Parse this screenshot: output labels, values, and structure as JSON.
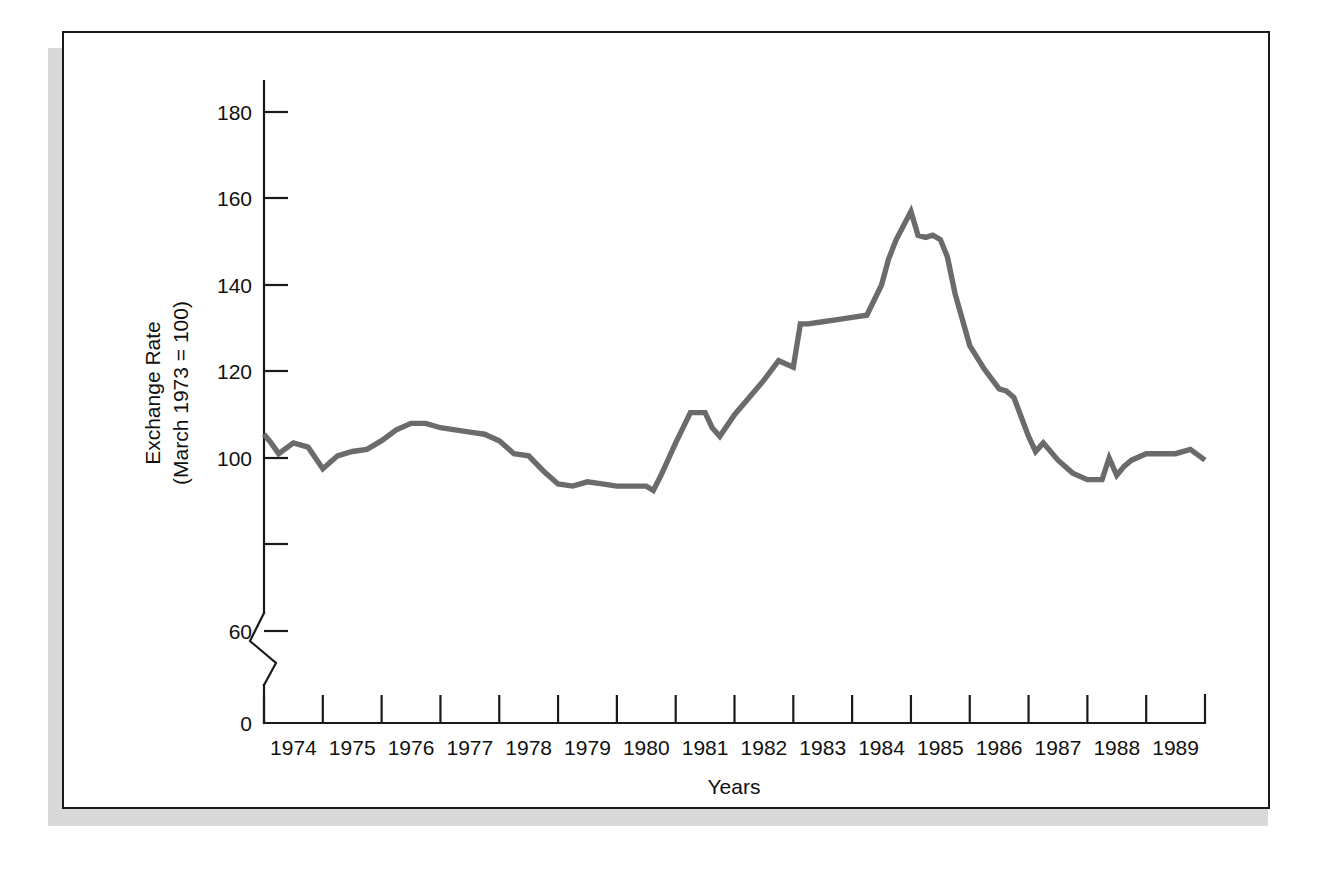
{
  "figure": {
    "frame": {
      "border_color": "#1a1a1a",
      "shadow_color": "#d9d9d9",
      "background": "#ffffff"
    }
  },
  "chart_data": {
    "type": "line",
    "title": "",
    "xlabel": "Years",
    "ylabel_line1": "Exchange Rate",
    "ylabel_line2": "(March 1973 = 100)",
    "line_color": "#6b6b6b",
    "axis_color": "#1a1a1a",
    "grid": false,
    "legend": "none",
    "axis_break": {
      "present": true,
      "between": [
        0,
        60
      ],
      "style": "zigzag"
    },
    "ylim": [
      56,
      190
    ],
    "yticks": [
      0,
      60,
      80,
      100,
      120,
      140,
      160,
      180
    ],
    "ytick_labels": [
      "0",
      "60",
      "",
      "100",
      "120",
      "140",
      "160",
      "180"
    ],
    "xlim": [
      1974.0,
      1990.0
    ],
    "xticks": [
      1974,
      1975,
      1976,
      1977,
      1978,
      1979,
      1980,
      1981,
      1982,
      1983,
      1984,
      1985,
      1986,
      1987,
      1988,
      1989,
      1990
    ],
    "xtick_labels": [
      "1974",
      "1975",
      "1976",
      "1977",
      "1978",
      "1979",
      "1980",
      "1981",
      "1982",
      "1983",
      "1984",
      "1985",
      "1986",
      "1987",
      "1988",
      "1989"
    ],
    "series": [
      {
        "name": "Trade-weighted exchange rate index",
        "x": [
          1974.0,
          1974.12,
          1974.25,
          1974.5,
          1974.75,
          1975.0,
          1975.25,
          1975.5,
          1975.75,
          1976.0,
          1976.25,
          1976.5,
          1976.75,
          1977.0,
          1977.25,
          1977.5,
          1977.75,
          1978.0,
          1978.25,
          1978.5,
          1978.75,
          1979.0,
          1979.25,
          1979.5,
          1979.75,
          1980.0,
          1980.25,
          1980.5,
          1980.62,
          1980.75,
          1981.0,
          1981.25,
          1981.5,
          1981.62,
          1981.75,
          1982.0,
          1982.25,
          1982.5,
          1982.75,
          1983.0,
          1983.12,
          1983.25,
          1983.5,
          1983.75,
          1984.0,
          1984.25,
          1984.5,
          1984.62,
          1984.75,
          1985.0,
          1985.12,
          1985.25,
          1985.37,
          1985.5,
          1985.62,
          1985.75,
          1986.0,
          1986.25,
          1986.5,
          1986.62,
          1986.75,
          1987.0,
          1987.12,
          1987.25,
          1987.5,
          1987.75,
          1988.0,
          1988.25,
          1988.37,
          1988.5,
          1988.62,
          1988.75,
          1989.0,
          1989.25,
          1989.5,
          1989.75,
          1990.0
        ],
        "y": [
          105.5,
          103.5,
          101.0,
          103.5,
          102.5,
          97.5,
          100.5,
          101.5,
          102.0,
          104.0,
          106.5,
          108.0,
          108.0,
          107.0,
          106.5,
          106.0,
          105.5,
          104.0,
          101.0,
          100.5,
          97.0,
          94.0,
          93.5,
          94.5,
          94.0,
          93.5,
          93.5,
          93.5,
          92.5,
          96.0,
          103.5,
          110.5,
          110.5,
          107.0,
          105.0,
          110.0,
          114.0,
          118.0,
          122.5,
          121.0,
          131.0,
          131.0,
          131.5,
          132.0,
          132.5,
          133.0,
          140.0,
          146.0,
          150.5,
          157.0,
          151.5,
          151.0,
          151.5,
          150.5,
          146.5,
          138.0,
          126.0,
          120.5,
          116.0,
          115.5,
          114.0,
          105.0,
          101.5,
          103.5,
          99.5,
          96.5,
          95.0,
          95.0,
          100.0,
          96.0,
          98.0,
          99.5,
          101.0,
          101.0,
          101.0,
          102.0,
          99.5
        ]
      }
    ]
  }
}
